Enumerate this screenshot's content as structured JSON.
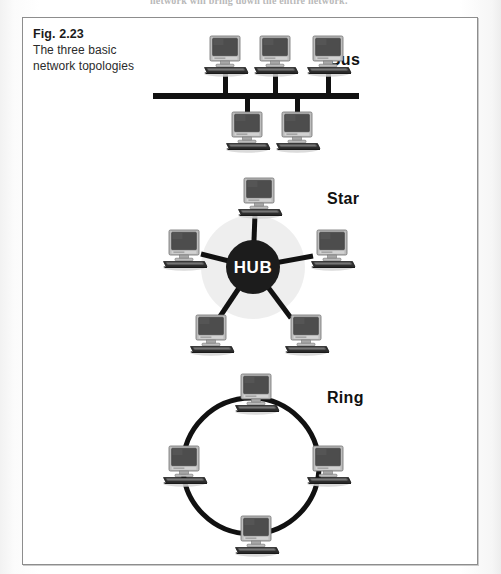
{
  "page": {
    "background_color": "#ffffff",
    "cut_off_running_text": "network will bring down the entire network."
  },
  "figure": {
    "border_color": "#8d8d8d",
    "caption": {
      "figure_number": "Fig. 2.23",
      "description_line_1": "The three basic",
      "description_line_2": "network topologies"
    }
  },
  "diagrams": [
    {
      "id": "bus",
      "title": "Bus",
      "title_position": {
        "x": 306,
        "y": 33
      },
      "backbone": {
        "x1": 130,
        "y1": 78,
        "x2": 336,
        "y2": 78,
        "thickness": 6
      },
      "top_nodes": [
        {
          "label": "workstation",
          "x": 181,
          "y": 18
        },
        {
          "label": "workstation",
          "x": 231,
          "y": 18
        },
        {
          "label": "workstation",
          "x": 284,
          "y": 18
        }
      ],
      "bottom_nodes": [
        {
          "label": "workstation",
          "x": 203,
          "y": 94
        },
        {
          "label": "workstation",
          "x": 253,
          "y": 94
        }
      ],
      "drop_color": "#111111"
    },
    {
      "id": "star",
      "title": "Star",
      "title_position": {
        "x": 304,
        "y": 172
      },
      "hub": {
        "label": "HUB",
        "center_x": 230,
        "center_y": 249,
        "radius": 27,
        "fill_color": "#1c1c1c",
        "text_color": "#ffffff"
      },
      "nodes": [
        {
          "label": "workstation",
          "x": 215,
          "y": 160,
          "position": "top"
        },
        {
          "label": "workstation",
          "x": 140,
          "y": 212,
          "position": "left-upper"
        },
        {
          "label": "workstation",
          "x": 288,
          "y": 212,
          "position": "right-upper"
        },
        {
          "label": "workstation",
          "x": 167,
          "y": 297,
          "position": "left-lower"
        },
        {
          "label": "workstation",
          "x": 262,
          "y": 297,
          "position": "right-lower"
        }
      ],
      "spoke_color": "#111111",
      "spoke_thickness": 5
    },
    {
      "id": "ring",
      "title": "Ring",
      "title_position": {
        "x": 304,
        "y": 371
      },
      "ring": {
        "center_x": 228,
        "center_y": 448,
        "radius": 68,
        "stroke_color": "#111111",
        "stroke_thickness": 5
      },
      "nodes": [
        {
          "label": "workstation",
          "x": 212,
          "y": 356,
          "position": "top"
        },
        {
          "label": "workstation",
          "x": 140,
          "y": 428,
          "position": "left"
        },
        {
          "label": "workstation",
          "x": 284,
          "y": 428,
          "position": "right"
        },
        {
          "label": "workstation",
          "x": 212,
          "y": 498,
          "position": "bottom"
        }
      ]
    }
  ],
  "colors": {
    "ink": "#111111",
    "monitor_bezel": "#b9b9b9",
    "monitor_screen": "#4a4a4a",
    "keyboard": "#2c2c2c",
    "shadow": "#cfcfcf"
  }
}
